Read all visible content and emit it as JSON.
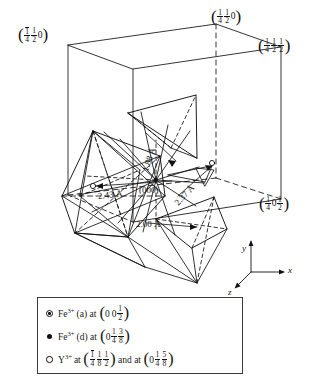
{
  "figure": {
    "type": "crystal-structure-unit-cell",
    "origin_label": "(000)",
    "angstrom": "Å"
  },
  "corner_labels": [
    {
      "id": "top-left",
      "overbar": "1",
      "den1": "4",
      "num2": "1",
      "den2": "2",
      "third": "0",
      "text": "(1̅4 1⁄2 0)"
    },
    {
      "id": "top-right",
      "num1": "1",
      "den1": "4",
      "num2": "1",
      "den2": "2",
      "third": "0",
      "text": "(1⁄4 1⁄2 0)"
    },
    {
      "id": "right-upper",
      "num1": "1",
      "den1": "4",
      "num2": "1",
      "den2": "2",
      "num3": "1",
      "den3": "2",
      "text": "(1⁄4 1⁄2 1⁄2)"
    },
    {
      "id": "right-lower",
      "num1": "1",
      "den1": "4",
      "mid": "0",
      "num3": "1",
      "den3": "2",
      "text": "(1⁄4 0 1⁄2)"
    }
  ],
  "distances": [
    {
      "name": "d-188",
      "value": "1.88",
      "unit": "Å",
      "label": "1.88 Å"
    },
    {
      "name": "d-237",
      "value": "2.37",
      "unit": "Å",
      "label": "2.37 Å"
    },
    {
      "name": "d-243",
      "value": "2.43",
      "unit": "Å",
      "label": "2.43 Å"
    },
    {
      "name": "d-200",
      "value": "2.00",
      "unit": "Å",
      "label": "2.00 Å"
    }
  ],
  "origin": {
    "label": "(000)"
  },
  "axes": [
    {
      "name": "y",
      "label": "y",
      "direction": "up"
    },
    {
      "name": "x",
      "label": "x",
      "direction": "right"
    },
    {
      "name": "z",
      "label": "z",
      "direction": "down-left"
    }
  ],
  "legend": {
    "rows": [
      {
        "marker": "circle-dot",
        "species": "Fe",
        "charge": "3+",
        "site": "(a)",
        "at": "at",
        "coords": [
          {
            "whole": "0",
            "whole2": "0",
            "num": "1",
            "den": "2"
          }
        ],
        "text": "Fe3+ (a) at (0 0 1/2)"
      },
      {
        "marker": "filled",
        "species": "Fe",
        "charge": "3+",
        "site": "(d)",
        "at": "at",
        "coords": [
          {
            "whole": "0",
            "num1": "1",
            "den1": "4",
            "num2": "3",
            "den2": "8"
          }
        ],
        "text": "Fe3+ (d) at (0 1/4 3/8)"
      },
      {
        "marker": "open",
        "species": "Y",
        "charge": "3+",
        "site": "",
        "at": "at",
        "and": "and at",
        "coords": [
          {
            "obnum": "1",
            "den1": "4",
            "num2": "1",
            "den2": "8",
            "num3": "1",
            "den3": "2"
          },
          {
            "whole": "0",
            "num1": "1",
            "den1": "4",
            "num2": "5",
            "den2": "8"
          }
        ],
        "text": "Y3+ at (1̅4 1/8 1/2) and at (0 1/4 5/8)"
      }
    ]
  },
  "colors": {
    "ink": "#111111",
    "background": "#ffffff",
    "legend_border": "#3a3a3a"
  }
}
